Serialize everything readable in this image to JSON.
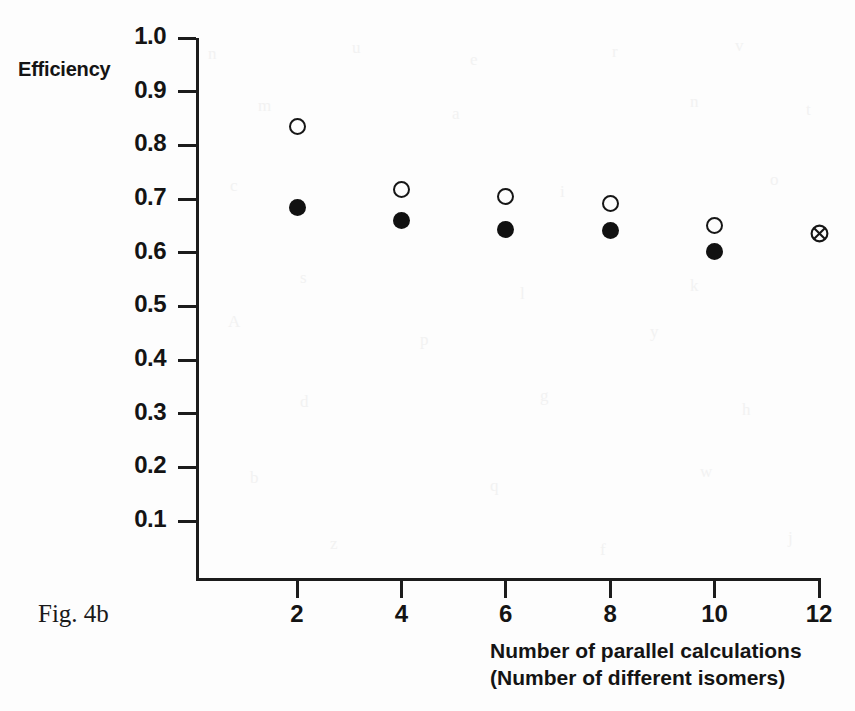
{
  "figure": {
    "caption": "Fig. 4b"
  },
  "axes": {
    "y_title": "Efficiency",
    "x_title_line1": "Number of parallel calculations",
    "x_title_line2": "(Number of different isomers)",
    "y_ticks": [
      "1.0",
      "0.9",
      "0.8",
      "0.7",
      "0.6",
      "0.5",
      "0.4",
      "0.3",
      "0.2",
      "0.1"
    ],
    "x_ticks": [
      "2",
      "4",
      "6",
      "8",
      "10",
      "12"
    ]
  },
  "chart_data": {
    "type": "scatter",
    "title": "Fig. 4b",
    "xlabel": "Number of parallel calculations (Number of different isomers)",
    "ylabel": "Efficiency",
    "xlim": [
      0,
      12
    ],
    "ylim": [
      0,
      1.0
    ],
    "x_tick_values": [
      2,
      4,
      6,
      8,
      10,
      12
    ],
    "y_tick_values": [
      0.1,
      0.2,
      0.3,
      0.4,
      0.5,
      0.6,
      0.7,
      0.8,
      0.9,
      1.0
    ],
    "grid": false,
    "legend": "none",
    "series": [
      {
        "name": "open-circle",
        "marker": "open circle",
        "x": [
          2,
          4,
          6,
          8,
          10
        ],
        "values": [
          0.836,
          0.717,
          0.705,
          0.692,
          0.651
        ]
      },
      {
        "name": "filled-circle",
        "marker": "filled circle",
        "x": [
          2,
          4,
          6,
          8,
          10
        ],
        "values": [
          0.684,
          0.66,
          0.643,
          0.641,
          0.603
        ]
      },
      {
        "name": "crossed-circle",
        "marker": "circle with cross",
        "x": [
          12
        ],
        "values": [
          0.636
        ]
      }
    ]
  },
  "bleed_artifacts": [
    {
      "text": "n",
      "left": 208,
      "top": 44
    },
    {
      "text": "u",
      "left": 352,
      "top": 38
    },
    {
      "text": "e",
      "left": 470,
      "top": 50
    },
    {
      "text": "r",
      "left": 612,
      "top": 42
    },
    {
      "text": "v",
      "left": 735,
      "top": 36
    },
    {
      "text": "m",
      "left": 258,
      "top": 96
    },
    {
      "text": "a",
      "left": 452,
      "top": 104
    },
    {
      "text": "n",
      "left": 690,
      "top": 92
    },
    {
      "text": "t",
      "left": 806,
      "top": 100
    },
    {
      "text": "c",
      "left": 230,
      "top": 176
    },
    {
      "text": "i",
      "left": 560,
      "top": 182
    },
    {
      "text": "o",
      "left": 770,
      "top": 170
    },
    {
      "text": "s",
      "left": 300,
      "top": 268
    },
    {
      "text": "l",
      "left": 520,
      "top": 284
    },
    {
      "text": "k",
      "left": 690,
      "top": 276
    },
    {
      "text": "A",
      "left": 228,
      "top": 312
    },
    {
      "text": "p",
      "left": 420,
      "top": 330
    },
    {
      "text": "y",
      "left": 650,
      "top": 322
    },
    {
      "text": "d",
      "left": 300,
      "top": 392
    },
    {
      "text": "g",
      "left": 540,
      "top": 386
    },
    {
      "text": "h",
      "left": 742,
      "top": 400
    },
    {
      "text": "b",
      "left": 250,
      "top": 468
    },
    {
      "text": "q",
      "left": 490,
      "top": 476
    },
    {
      "text": "w",
      "left": 700,
      "top": 462
    },
    {
      "text": "z",
      "left": 330,
      "top": 534
    },
    {
      "text": "f",
      "left": 600,
      "top": 540
    },
    {
      "text": "j",
      "left": 788,
      "top": 528
    }
  ]
}
